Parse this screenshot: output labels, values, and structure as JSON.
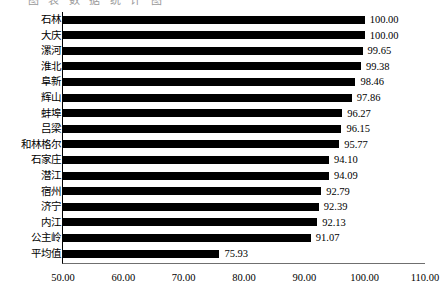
{
  "title_remnant": "图  表  数  据  统  计  图",
  "chart_data": {
    "type": "bar",
    "orientation": "horizontal",
    "title": "",
    "subtitle": "",
    "xlabel": "",
    "ylabel": "",
    "xlim": [
      50.0,
      110.0
    ],
    "xticks": [
      "50.00",
      "60.00",
      "70.00",
      "80.00",
      "90.00",
      "100.00",
      "110.00"
    ],
    "xtick_values": [
      50,
      60,
      70,
      80,
      90,
      100,
      110
    ],
    "grid": false,
    "legend": null,
    "bar_color": "#000000",
    "categories": [
      "石林",
      "大庆",
      "漯河",
      "淮北",
      "阜新",
      "辉山",
      "蚌埠",
      "吕梁",
      "和林格尔",
      "石家庄",
      "潜江",
      "宿州",
      "济宁",
      "内江",
      "公主岭",
      "平均值"
    ],
    "values": [
      100.0,
      100.0,
      99.65,
      99.38,
      98.46,
      97.86,
      96.27,
      96.15,
      95.77,
      94.1,
      94.09,
      92.79,
      92.39,
      92.13,
      91.07,
      75.93
    ],
    "value_labels": [
      "100.00",
      "100.00",
      "99.65",
      "99.38",
      "98.46",
      "97.86",
      "96.27",
      "96.15",
      "95.77",
      "94.10",
      "94.09",
      "92.79",
      "92.39",
      "92.13",
      "91.07",
      "75.93"
    ]
  }
}
